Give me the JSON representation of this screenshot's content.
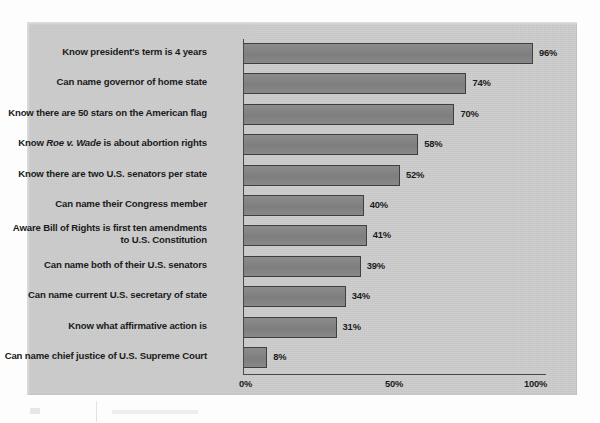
{
  "chart_data": {
    "type": "bar",
    "orientation": "horizontal",
    "title": "",
    "xlabel": "",
    "ylabel": "",
    "xlim": [
      0,
      100
    ],
    "grid": false,
    "legend": null,
    "value_suffix": "%",
    "categories": [
      "Know president's term is 4 years",
      "Can name governor of home state",
      "Know there are 50 stars on the American flag",
      "Know Roe v. Wade is about abortion rights",
      "Know there are two U.S. senators per state",
      "Can name their Congress member",
      "Aware Bill of Rights is first ten amendments to U.S. Constitution",
      "Can name both of their U.S. senators",
      "Can name current U.S. secretary of state",
      "Know what affirmative action is",
      "Can name chief justice of U.S. Supreme Court"
    ],
    "values": [
      96,
      74,
      70,
      58,
      52,
      40,
      41,
      39,
      34,
      31,
      8
    ],
    "value_labels": [
      "96%",
      "74%",
      "70%",
      "58%",
      "52%",
      "40%",
      "41%",
      "39%",
      "34%",
      "31%",
      "8%"
    ],
    "xticks": [
      0,
      50,
      100
    ],
    "xtick_labels": [
      "0%",
      "50%",
      "100%"
    ],
    "colors": {
      "bar_fill": "#848484",
      "bar_stroke": "#3f3f3f",
      "panel_background": "#cccccc",
      "text": "#1b1b1b",
      "axis": "#4a4a4a"
    }
  },
  "rows": [
    {
      "label_html": "Know president's term is 4 years",
      "label": "Know president's term is 4 years",
      "value": 96,
      "value_label": "96%"
    },
    {
      "label_html": "Can name governor of home state",
      "label": "Can name governor of home state",
      "value": 74,
      "value_label": "74%"
    },
    {
      "label_html": "Know there are 50 stars on the American flag",
      "label": "Know there are 50 stars on the American flag",
      "value": 70,
      "value_label": "70%"
    },
    {
      "label_html": "Know <i>Roe v. Wade</i> is about abortion rights",
      "label": "Know Roe v. Wade is about abortion rights",
      "value": 58,
      "value_label": "58%"
    },
    {
      "label_html": "Know there are two U.S. senators per state",
      "label": "Know there are two U.S. senators per state",
      "value": 52,
      "value_label": "52%"
    },
    {
      "label_html": "Can name their Congress member",
      "label": "Can name their Congress member",
      "value": 40,
      "value_label": "40%"
    },
    {
      "label_html": "Aware Bill of Rights is first ten amendments<br>to U.S. Constitution",
      "label": "Aware Bill of Rights is first ten amendments to U.S. Constitution",
      "value": 41,
      "value_label": "41%"
    },
    {
      "label_html": "Can name both of their U.S. senators",
      "label": "Can name both of their U.S. senators",
      "value": 39,
      "value_label": "39%"
    },
    {
      "label_html": "Can name current U.S. secretary of state",
      "label": "Can name current U.S. secretary of state",
      "value": 34,
      "value_label": "34%"
    },
    {
      "label_html": "Know what affirmative action is",
      "label": "Know what affirmative action is",
      "value": 31,
      "value_label": "31%"
    },
    {
      "label_html": "Can name chief justice of U.S. Supreme Court",
      "label": "Can name chief justice of U.S. Supreme Court",
      "value": 8,
      "value_label": "8%"
    }
  ],
  "axis": {
    "tick_0": "0%",
    "tick_50": "50%",
    "tick_100": "100%"
  }
}
